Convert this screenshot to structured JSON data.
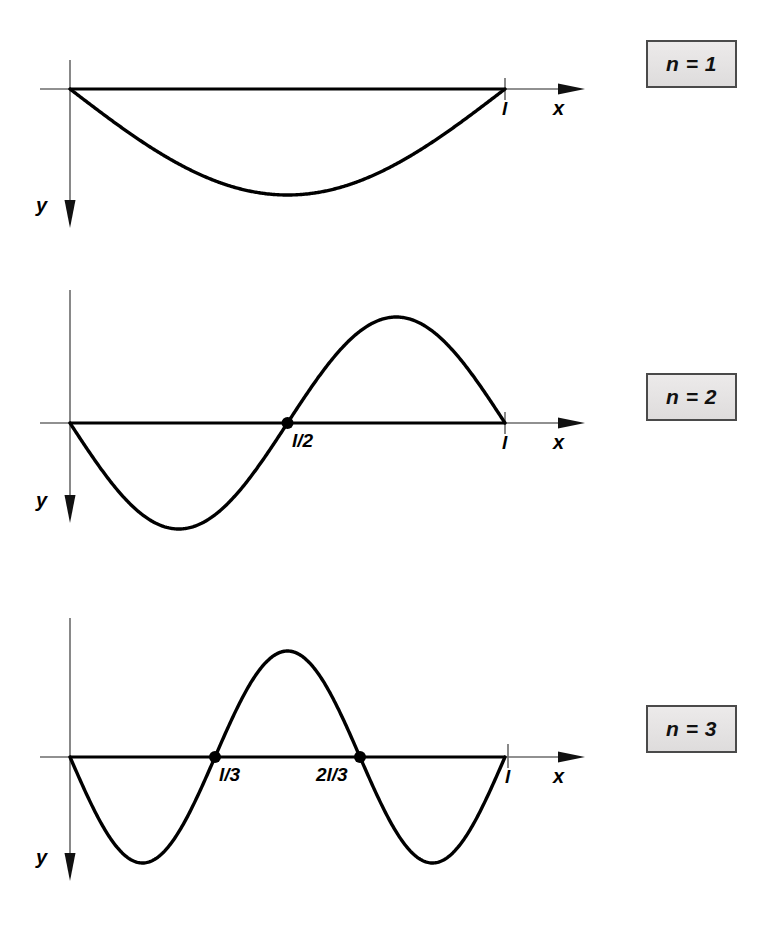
{
  "figure": {
    "background_color": "#ffffff",
    "ink_color": "#000000",
    "axis_color": "#6b6b6b",
    "box_fill_color": "#e6e4e4",
    "box_border_color": "#4a4a4a"
  },
  "panels": [
    {
      "id": "panel-n1",
      "mode_label": "n = 1",
      "x_axis_label": "x",
      "y_axis_label": "y",
      "tick_labels": [
        {
          "text": "l",
          "x_fraction": 1.0
        }
      ],
      "node_markers": []
    },
    {
      "id": "panel-n2",
      "mode_label": "n = 2",
      "x_axis_label": "x",
      "y_axis_label": "y",
      "tick_labels": [
        {
          "text": "l/2",
          "x_fraction": 0.5
        },
        {
          "text": "l",
          "x_fraction": 1.0
        }
      ],
      "node_markers": [
        {
          "x_fraction": 0.5
        }
      ]
    },
    {
      "id": "panel-n3",
      "mode_label": "n = 3",
      "x_axis_label": "x",
      "y_axis_label": "y",
      "tick_labels": [
        {
          "text": "l/3",
          "x_fraction": 0.3333
        },
        {
          "text": "2l/3",
          "x_fraction": 0.6667
        },
        {
          "text": "l",
          "x_fraction": 1.0
        }
      ],
      "node_markers": [
        {
          "x_fraction": 0.3333
        },
        {
          "x_fraction": 0.6667
        }
      ]
    }
  ],
  "chart_data": {
    "type": "line",
    "xlabel": "x",
    "ylabel": "y",
    "note": "y axis points downward; curves are y = A sin(n*pi*x/l) plotted with positive y downward",
    "xlim": [
      0,
      1
    ],
    "ylim": [
      -1,
      1
    ],
    "grid": false,
    "legend": "none",
    "x_domain_label": "0 to l",
    "series": [
      {
        "name": "n = 1",
        "n": 1,
        "formula": "y = sin(pi*x/l)",
        "nodes": [
          0,
          1
        ],
        "node_labels": [
          "0",
          "l"
        ],
        "x": [
          0,
          0.05,
          0.1,
          0.15,
          0.2,
          0.25,
          0.3,
          0.35,
          0.4,
          0.45,
          0.5,
          0.55,
          0.6,
          0.65,
          0.7,
          0.75,
          0.8,
          0.85,
          0.9,
          0.95,
          1.0
        ],
        "values": [
          0,
          0.156,
          0.309,
          0.454,
          0.588,
          0.707,
          0.809,
          0.891,
          0.951,
          0.988,
          1.0,
          0.988,
          0.951,
          0.891,
          0.809,
          0.707,
          0.588,
          0.454,
          0.309,
          0.156,
          0
        ]
      },
      {
        "name": "n = 2",
        "n": 2,
        "formula": "y = sin(2*pi*x/l)",
        "nodes": [
          0,
          0.5,
          1
        ],
        "node_labels": [
          "0",
          "l/2",
          "l"
        ],
        "x": [
          0,
          0.05,
          0.1,
          0.15,
          0.2,
          0.25,
          0.3,
          0.35,
          0.4,
          0.45,
          0.5,
          0.55,
          0.6,
          0.65,
          0.7,
          0.75,
          0.8,
          0.85,
          0.9,
          0.95,
          1.0
        ],
        "values": [
          0,
          0.309,
          0.588,
          0.809,
          0.951,
          1.0,
          0.951,
          0.809,
          0.588,
          0.309,
          0,
          -0.309,
          -0.588,
          -0.809,
          -0.951,
          -1.0,
          -0.951,
          -0.809,
          -0.588,
          -0.309,
          0
        ]
      },
      {
        "name": "n = 3",
        "n": 3,
        "formula": "y = sin(3*pi*x/l)",
        "nodes": [
          0,
          0.3333,
          0.6667,
          1
        ],
        "node_labels": [
          "0",
          "l/3",
          "2l/3",
          "l"
        ],
        "x": [
          0,
          0.05,
          0.1,
          0.15,
          0.2,
          0.25,
          0.3,
          0.35,
          0.4,
          0.45,
          0.5,
          0.55,
          0.6,
          0.65,
          0.7,
          0.75,
          0.8,
          0.85,
          0.9,
          0.95,
          1.0
        ],
        "values": [
          0,
          0.454,
          0.809,
          0.988,
          0.951,
          0.707,
          0.309,
          -0.156,
          -0.588,
          -0.891,
          -1.0,
          -0.891,
          -0.588,
          -0.156,
          0.309,
          0.707,
          0.951,
          0.988,
          0.809,
          0.454,
          0
        ]
      }
    ]
  }
}
